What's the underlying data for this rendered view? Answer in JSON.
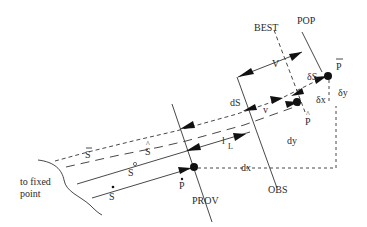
{
  "diagram": {
    "labels": {
      "pop": "POP",
      "best": "BEST",
      "obs": "OBS",
      "prov": "PROV",
      "p_bar": "P",
      "p_hat": "P",
      "p_dot": "P",
      "s_bar": "S",
      "s_hat": "S",
      "s_circ": "S",
      "s_dot": "S",
      "V": "V",
      "v": "v",
      "dS": "dS",
      "deltaS": "δS",
      "deltax": "δx",
      "deltay": "δy",
      "dx": "dx",
      "dy": "dy",
      "l": "l",
      "L": "L",
      "fixed_line1": "to fixed",
      "fixed_line2": "point"
    },
    "accents": {
      "bar": "‾",
      "hat": "^",
      "circ": "°",
      "dot": "•"
    },
    "colors": {
      "stroke": "#333333",
      "text": "#2a2a2a",
      "background": "#ffffff"
    }
  }
}
